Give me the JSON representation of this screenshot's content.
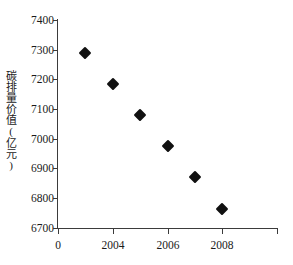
{
  "chart_data": {
    "type": "scatter",
    "title": "",
    "xlabel": "",
    "ylabel": "碳排量价值(亿元)",
    "x": [
      2003,
      2004,
      2005,
      2006,
      2007,
      2008
    ],
    "values": [
      7290,
      7185,
      7080,
      6975,
      6870,
      6765
    ],
    "series": [
      {
        "name": "碳排量价值(亿元)",
        "points": [
          {
            "x": 2003,
            "y": 7290
          },
          {
            "x": 2004,
            "y": 7185
          },
          {
            "x": 2005,
            "y": 7080
          },
          {
            "x": 2006,
            "y": 6975
          },
          {
            "x": 2007,
            "y": 6870
          },
          {
            "x": 2008,
            "y": 6765
          }
        ]
      }
    ],
    "xlim": [
      2002,
      2010
    ],
    "ylim": [
      6700,
      7400
    ],
    "y_ticks": [
      6700,
      6800,
      6900,
      7000,
      7100,
      7200,
      7300,
      7400
    ],
    "x_ticks": [
      0,
      2004,
      2006,
      2008
    ],
    "x_tick_positions": [
      2002,
      2004,
      2006,
      2008,
      2010
    ],
    "grid": false,
    "legend": false,
    "marker": "diamond",
    "marker_color": "#111111",
    "axis_color": "#3b3b3b"
  },
  "axes": {
    "y_tick_labels": [
      "7400",
      "7300",
      "7200",
      "7100",
      "7000",
      "6900",
      "6800",
      "6700"
    ],
    "x_tick_labels": [
      "0",
      "2004",
      "2006",
      "2008"
    ],
    "y_title": "碳排量价值(亿元)"
  },
  "caption": ""
}
